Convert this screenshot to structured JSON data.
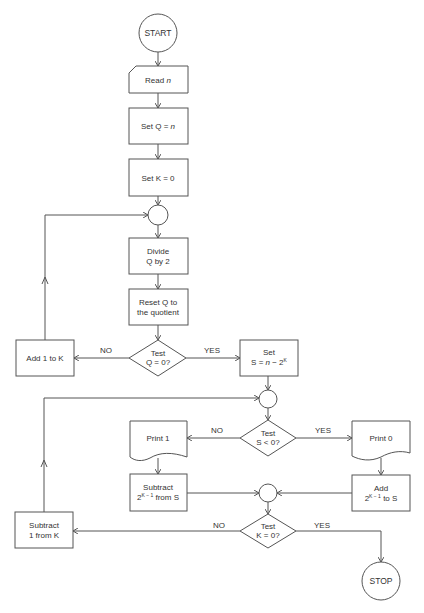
{
  "flowchart": {
    "start": "START",
    "read": {
      "prefix": "Read ",
      "var": "n"
    },
    "set_q": {
      "prefix": "Set Q  =  ",
      "var": "n"
    },
    "set_k": "Set K  =  0",
    "divide": [
      "Divide",
      "Q by 2"
    ],
    "reset": [
      "Reset Q to",
      "the quotient"
    ],
    "test_q": [
      "Test",
      "Q  =  0?"
    ],
    "add_k": "Add 1 to  K",
    "set_s": {
      "line1": "Set",
      "line2_prefix": "S  =  ",
      "var": "n",
      "line2_mid": "  −  2",
      "sup": "K"
    },
    "test_s": [
      "Test",
      "S  <  0?"
    ],
    "print1": "Print 1",
    "print0": "Print 0",
    "subtract_s": {
      "line1": "Subtract",
      "base": "2",
      "sup": "K − 1",
      "rest": " from S"
    },
    "add_s": {
      "line1": "Add",
      "base": "2",
      "sup": "K − 1",
      "rest": " to S"
    },
    "test_k": [
      "Test",
      "K  =  0?"
    ],
    "subtract_k": [
      "Subtract",
      "1 from K"
    ],
    "stop": "STOP",
    "labels": {
      "no_q": "NO",
      "yes_q": "YES",
      "no_s": "NO",
      "yes_s": "YES",
      "no_k": "NO",
      "yes_k": "YES"
    }
  },
  "colors": {
    "stroke": "#555555",
    "text": "#333333",
    "background": "#ffffff"
  }
}
